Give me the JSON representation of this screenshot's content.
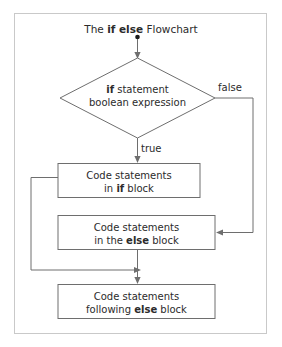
{
  "diagram": {
    "title": {
      "prefix": "The ",
      "keyword": "if else",
      "suffix": " Flowchart"
    },
    "decision": {
      "name": "if-statement-decision",
      "line1_bold": "if",
      "line1_rest": " statement",
      "line2": "boolean expression"
    },
    "edge_labels": {
      "true": "true",
      "false": "false"
    },
    "boxes": [
      {
        "name": "if-block-process",
        "line1": "Code statements",
        "line2_prefix": "in ",
        "line2_bold": "if",
        "line2_suffix": " block"
      },
      {
        "name": "else-block-process",
        "line1": "Code statements",
        "line2_prefix": "in the ",
        "line2_bold": "else",
        "line2_suffix": " block"
      },
      {
        "name": "following-else-process",
        "line1": "Code statements",
        "line2_prefix": "following ",
        "line2_bold": "else",
        "line2_suffix": " block"
      }
    ],
    "colors": {
      "stroke": "#6e6e6e",
      "frame": "#c9c9c9",
      "text": "#2b2b2b",
      "background": "#ffffff"
    }
  }
}
